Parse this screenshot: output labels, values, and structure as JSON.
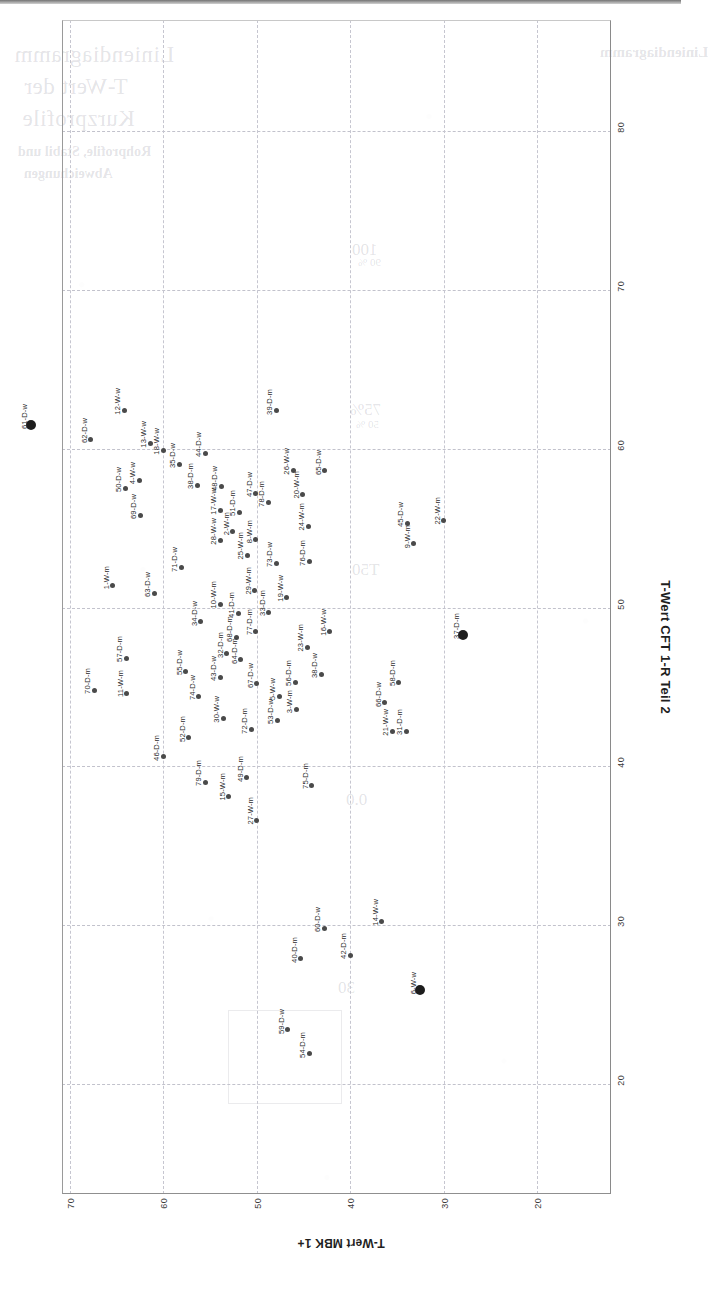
{
  "page": {
    "orientation": "landscape-rotated-90",
    "ghost_text": {
      "title_line1": "Liniendiagramm",
      "title_line2": "T-Wert der",
      "title_line3": "Kurzprofile",
      "sub_line1": "Rohprofile, Stabil und",
      "sub_line2": "Abweichungen",
      "corner": "Liniendiagramm",
      "note1": "100",
      "note2": "90 %",
      "note3": "75%",
      "note4": "50 %",
      "note5": "T50",
      "note6": "0.0",
      "note7": "30"
    }
  },
  "chart_data": {
    "type": "scatter",
    "title": "",
    "xlabel": "T-Wert CFT 1-R Teil 2",
    "ylabel": "T-Wert MBK 1+",
    "xlim": [
      15,
      85
    ],
    "ylim": [
      18,
      72
    ],
    "xticks": [
      80,
      70,
      60,
      50,
      40,
      30,
      20
    ],
    "yticks": [
      70,
      60,
      50,
      40,
      30,
      20
    ],
    "grid": true,
    "legend": "none",
    "marker_color": "#4a4a4a",
    "highlight_color": "#1d1d1d",
    "points": [
      {
        "label": "61-D-w",
        "x": 61.5,
        "y": 74.2,
        "big": true
      },
      {
        "label": "62-D-w",
        "x": 60.6,
        "y": 67.8,
        "big": false
      },
      {
        "label": "70-D-m",
        "x": 44.8,
        "y": 67.4,
        "big": false
      },
      {
        "label": "1-W-m",
        "x": 51.4,
        "y": 65.4,
        "big": false
      },
      {
        "label": "12-W-w",
        "x": 62.4,
        "y": 64.2,
        "big": false
      },
      {
        "label": "50-D-w",
        "x": 57.5,
        "y": 64.1,
        "big": false
      },
      {
        "label": "57-D-m",
        "x": 46.8,
        "y": 64.0,
        "big": false
      },
      {
        "label": "11-W-m",
        "x": 44.6,
        "y": 63.9,
        "big": false
      },
      {
        "label": "4-W-w",
        "x": 58.0,
        "y": 62.6,
        "big": false
      },
      {
        "label": "69-D-w",
        "x": 55.8,
        "y": 62.5,
        "big": false
      },
      {
        "label": "13-W-w",
        "x": 60.3,
        "y": 61.4,
        "big": false
      },
      {
        "label": "63-D-w",
        "x": 50.9,
        "y": 61.0,
        "big": false
      },
      {
        "label": "18-W-w",
        "x": 59.9,
        "y": 60.0,
        "big": false
      },
      {
        "label": "46-D-m",
        "x": 40.6,
        "y": 60.0,
        "big": false
      },
      {
        "label": "35-D-w",
        "x": 59.0,
        "y": 58.3,
        "big": false
      },
      {
        "label": "71-D-w",
        "x": 52.5,
        "y": 58.1,
        "big": false
      },
      {
        "label": "55-D-w",
        "x": 46.0,
        "y": 57.6,
        "big": false
      },
      {
        "label": "52-D-m",
        "x": 41.8,
        "y": 57.3,
        "big": false
      },
      {
        "label": "38-D-m",
        "x": 57.7,
        "y": 56.4,
        "big": false
      },
      {
        "label": "44-D-w",
        "x": 59.7,
        "y": 55.5,
        "big": false
      },
      {
        "label": "34-D-w",
        "x": 49.1,
        "y": 56.0,
        "big": false
      },
      {
        "label": "74-D-w",
        "x": 44.4,
        "y": 56.2,
        "big": false
      },
      {
        "label": "79-D-m",
        "x": 39.0,
        "y": 55.5,
        "big": false
      },
      {
        "label": "48-D-w",
        "x": 57.6,
        "y": 53.8,
        "big": false
      },
      {
        "label": "17-W-w",
        "x": 56.1,
        "y": 53.9,
        "big": false
      },
      {
        "label": "28-W-w",
        "x": 54.2,
        "y": 53.9,
        "big": false
      },
      {
        "label": "10-W-m",
        "x": 50.2,
        "y": 53.9,
        "big": false
      },
      {
        "label": "43-D-w",
        "x": 45.6,
        "y": 53.9,
        "big": false
      },
      {
        "label": "30-W-w",
        "x": 43.0,
        "y": 53.6,
        "big": false
      },
      {
        "label": "2-W-m",
        "x": 54.8,
        "y": 52.6,
        "big": false
      },
      {
        "label": "32-D-m",
        "x": 47.1,
        "y": 53.2,
        "big": false
      },
      {
        "label": "51-D-m",
        "x": 56.0,
        "y": 51.9,
        "big": false
      },
      {
        "label": "41-D-m",
        "x": 49.6,
        "y": 52.0,
        "big": false
      },
      {
        "label": "68-D-m",
        "x": 48.1,
        "y": 52.2,
        "big": false
      },
      {
        "label": "64-D-m",
        "x": 46.7,
        "y": 51.7,
        "big": false
      },
      {
        "label": "15-W-m",
        "x": 38.1,
        "y": 53.0,
        "big": false
      },
      {
        "label": "25-W-m",
        "x": 53.3,
        "y": 51.0,
        "big": false
      },
      {
        "label": "49-D-m",
        "x": 39.3,
        "y": 51.1,
        "big": false
      },
      {
        "label": "72-D-m",
        "x": 42.3,
        "y": 50.6,
        "big": false
      },
      {
        "label": "67-D-w",
        "x": 45.2,
        "y": 50.0,
        "big": false
      },
      {
        "label": "47-D-w",
        "x": 57.2,
        "y": 50.1,
        "big": false
      },
      {
        "label": "8-W-m",
        "x": 54.3,
        "y": 50.1,
        "big": false
      },
      {
        "label": "29-W-m",
        "x": 51.1,
        "y": 50.2,
        "big": false
      },
      {
        "label": "77-D-m",
        "x": 48.5,
        "y": 50.1,
        "big": false
      },
      {
        "label": "27-W-m",
        "x": 36.6,
        "y": 50.0,
        "big": false
      },
      {
        "label": "78-D-m",
        "x": 56.6,
        "y": 48.8,
        "big": false
      },
      {
        "label": "33-D-m",
        "x": 49.7,
        "y": 48.7,
        "big": false
      },
      {
        "label": "39-D-m",
        "x": 62.4,
        "y": 47.9,
        "big": false
      },
      {
        "label": "73-D-w",
        "x": 52.8,
        "y": 47.9,
        "big": false
      },
      {
        "label": "5-W-w",
        "x": 44.4,
        "y": 47.6,
        "big": false
      },
      {
        "label": "53-D-w",
        "x": 42.9,
        "y": 47.8,
        "big": false
      },
      {
        "label": "19-W-w",
        "x": 50.6,
        "y": 46.8,
        "big": false
      },
      {
        "label": "26-W-w",
        "x": 58.6,
        "y": 46.1,
        "big": false
      },
      {
        "label": "56-D-m",
        "x": 45.3,
        "y": 45.9,
        "big": false
      },
      {
        "label": "3-W-m",
        "x": 43.6,
        "y": 45.8,
        "big": false
      },
      {
        "label": "59-D-w",
        "x": 23.4,
        "y": 46.7,
        "big": false
      },
      {
        "label": "20-W-m",
        "x": 57.1,
        "y": 45.1,
        "big": false
      },
      {
        "label": "40-D-m",
        "x": 27.9,
        "y": 45.3,
        "big": false
      },
      {
        "label": "24-W-m",
        "x": 55.1,
        "y": 44.5,
        "big": false
      },
      {
        "label": "76-D-m",
        "x": 52.9,
        "y": 44.4,
        "big": false
      },
      {
        "label": "23-W-m",
        "x": 47.5,
        "y": 44.6,
        "big": false
      },
      {
        "label": "54-D-m",
        "x": 21.9,
        "y": 44.4,
        "big": false
      },
      {
        "label": "75-D-m",
        "x": 38.8,
        "y": 44.1,
        "big": false
      },
      {
        "label": "38-D-w",
        "x": 45.8,
        "y": 43.1,
        "big": false
      },
      {
        "label": "65-D-w",
        "x": 58.6,
        "y": 42.7,
        "big": false
      },
      {
        "label": "16-W-w",
        "x": 48.5,
        "y": 42.2,
        "big": false
      },
      {
        "label": "60-D-w",
        "x": 29.8,
        "y": 42.8,
        "big": false
      },
      {
        "label": "42-D-m",
        "x": 28.1,
        "y": 40.0,
        "big": false
      },
      {
        "label": "66-D-w",
        "x": 44.0,
        "y": 36.3,
        "big": false
      },
      {
        "label": "14-W-w",
        "x": 30.2,
        "y": 36.6,
        "big": false
      },
      {
        "label": "21-W-w",
        "x": 42.2,
        "y": 35.5,
        "big": false
      },
      {
        "label": "58-D-m",
        "x": 45.3,
        "y": 34.8,
        "big": false
      },
      {
        "label": "31-D-m",
        "x": 42.2,
        "y": 34.0,
        "big": false
      },
      {
        "label": "45-D-w",
        "x": 55.3,
        "y": 33.9,
        "big": false
      },
      {
        "label": "9-W-m",
        "x": 54.0,
        "y": 33.2,
        "big": false
      },
      {
        "label": "6-W-w",
        "x": 25.9,
        "y": 32.5,
        "big": true
      },
      {
        "label": "22-W-m",
        "x": 55.5,
        "y": 30.0,
        "big": false
      },
      {
        "label": "37-D-m",
        "x": 48.3,
        "y": 27.9,
        "big": true
      }
    ]
  }
}
